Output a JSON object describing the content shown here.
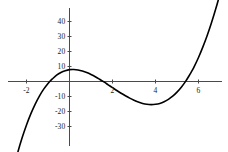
{
  "chart_data": {
    "type": "line",
    "title": "",
    "subtitle": "",
    "xlabel": "",
    "ylabel": "",
    "xlim": [
      -2.8,
      7.4
    ],
    "ylim": [
      -34,
      47
    ],
    "grid": false,
    "legend": null,
    "axes_style": "cross-origin",
    "x_ticks": [
      -2,
      2,
      4,
      6
    ],
    "x_tick_labels": [
      "-2",
      "2",
      "4",
      "6"
    ],
    "y_ticks": [
      40,
      30,
      20,
      10,
      -10,
      -20,
      -30
    ],
    "y_tick_labels": [
      "40",
      "30",
      "20",
      "10",
      "-10",
      "-20",
      "-30"
    ],
    "series": [
      {
        "name": "cubic",
        "color": "#000000",
        "x": [
          -2.55,
          -2.4,
          -2.2,
          -2.0,
          -1.8,
          -1.6,
          -1.4,
          -1.2,
          -1.0,
          -0.9,
          -0.8,
          -0.6,
          -0.4,
          -0.2,
          0.0,
          0.2,
          0.4,
          0.6,
          0.8,
          1.0,
          1.2,
          1.4,
          1.6,
          1.8,
          2.0,
          2.2,
          2.4,
          2.6,
          2.8,
          3.0,
          3.2,
          3.4,
          3.6,
          3.8,
          4.0,
          4.2,
          4.4,
          4.6,
          4.8,
          5.0,
          5.2,
          5.4,
          5.6,
          5.7,
          5.8,
          6.0,
          6.2,
          6.4,
          6.6,
          6.8,
          6.95
        ],
        "y": [
          -55.6,
          -47.0,
          -37.4,
          -29.0,
          -21.6,
          -15.2,
          -9.7,
          -5.1,
          -1.3,
          0.3,
          1.7,
          4.2,
          6.0,
          7.2,
          7.9,
          8.0,
          7.7,
          7.0,
          6.0,
          4.7,
          3.2,
          1.5,
          -0.3,
          -2.2,
          -4.1,
          -6.0,
          -7.8,
          -9.5,
          -11.1,
          -12.5,
          -13.7,
          -14.6,
          -15.2,
          -15.4,
          -15.2,
          -14.6,
          -13.5,
          -11.9,
          -9.8,
          -7.1,
          -3.8,
          0.1,
          4.7,
          7.2,
          9.9,
          16.0,
          22.9,
          30.5,
          39.0,
          48.3,
          55.9
        ]
      }
    ],
    "notes": {
      "roots_approx": [
        -0.9,
        1.6,
        5.7
      ],
      "local_min": {
        "x": 0.2,
        "y": -10
      },
      "local_max": {
        "x": 4.0,
        "y": 23
      },
      "y_intercept": -10
    }
  },
  "colors": {
    "curve": "#000000",
    "axis": "#4a4a4a",
    "tick_text": "#1a1a1a",
    "background": "#ffffff"
  }
}
